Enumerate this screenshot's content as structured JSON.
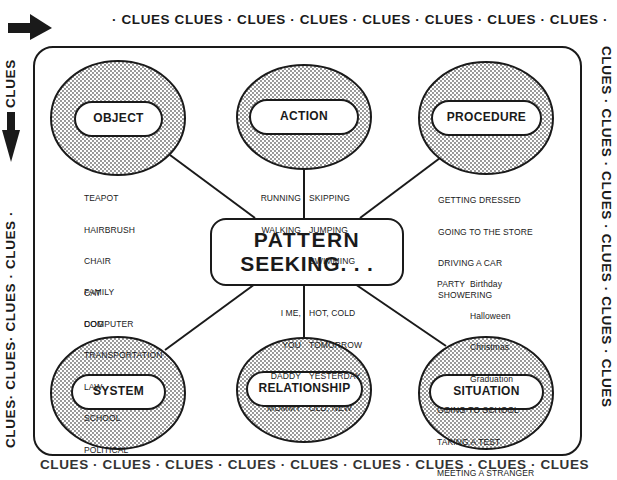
{
  "border_bands": {
    "top": "· CLUES  CLUES · CLUES · CLUES · CLUES · CLUES · CLUES · CLUES ·",
    "left": "CLUES· CLUES· CLUES · CLUES ·   ",
    "left_top": "CLUES",
    "right": "CLUES · CLUES · CLUES · CLUES · CLUES · CLUES",
    "bottom": "CLUES · CLUES · CLUES · CLUES · CLUES · CLUES · CLUES · CLUES · CLUES"
  },
  "arrows": {
    "top": "right-arrow-icon",
    "left": "down-arrow-icon"
  },
  "center": {
    "line1": "PATTERN",
    "line2": "SEEKING. . ."
  },
  "categories": {
    "object": {
      "label": "OBJECT",
      "examples": [
        "TEAPOT",
        "HAIRBRUSH",
        "CHAIR",
        "CAT",
        "DOG"
      ]
    },
    "action": {
      "label": "ACTION",
      "examples_left": [
        "RUNNING",
        "WALKING"
      ],
      "examples_right": [
        "SKIPPING",
        "JUMPING",
        "SWIMMING"
      ]
    },
    "procedure": {
      "label": "PROCEDURE",
      "examples": [
        "GETTING DRESSED",
        "GOING TO THE STORE",
        "DRIVING A CAR",
        "SHOWERING"
      ]
    },
    "system": {
      "label": "SYSTEM",
      "examples": [
        "FAMILY",
        "COMPUTER",
        "TRANSPORTATION",
        "LAW",
        "SCHOOL",
        "POLITICAL"
      ]
    },
    "relationship": {
      "label": "RELATIONSHIP",
      "examples_left": [
        "I ME,",
        "YOU",
        "DADDY",
        "MOMMY"
      ],
      "examples_right": [
        "HOT, COLD",
        "TOMORROW",
        "YESTERDAY",
        "OLD, NEW"
      ]
    },
    "situation": {
      "label": "SITUATION",
      "party_label": "PARTY",
      "party_items": [
        "Birthday",
        "Halloween",
        "Christmas",
        "Graduation"
      ],
      "examples": [
        "GOING TO SCHOOL",
        "TAKING A TEST",
        "MEETING A STRANGER"
      ]
    }
  },
  "colors": {
    "ink": "#1a1a1a",
    "paper": "#ffffff",
    "stipple": "#9a9a9a"
  }
}
